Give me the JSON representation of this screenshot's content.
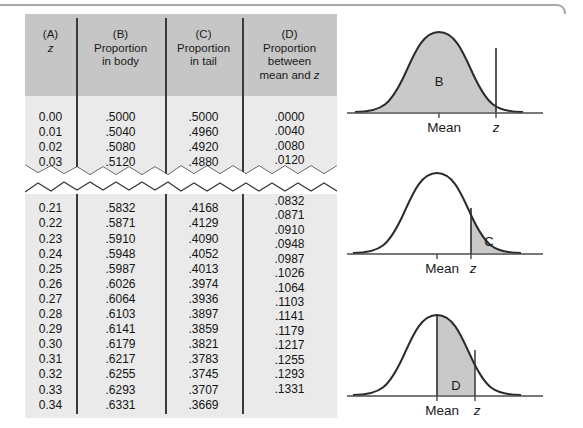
{
  "table": {
    "headers": [
      {
        "tag": "(A)",
        "lines": [
          "z"
        ],
        "italic_last": true
      },
      {
        "tag": "(B)",
        "lines": [
          "Proportion",
          "in body"
        ],
        "italic_last": false
      },
      {
        "tag": "(C)",
        "lines": [
          "Proportion",
          "in tail"
        ],
        "italic_last": false
      },
      {
        "tag": "(D)",
        "lines": [
          "Proportion",
          "between",
          "mean and z"
        ],
        "italic_last": false
      }
    ],
    "column_a_top": [
      "0.00",
      "0.01",
      "0.02",
      "0.03"
    ],
    "column_b_top": [
      ".5000",
      ".5040",
      ".5080",
      ".5120"
    ],
    "column_c_top": [
      ".5000",
      ".4960",
      ".4920",
      ".4880"
    ],
    "column_d_top": [
      ".0000",
      ".0040",
      ".0080",
      ".0120"
    ],
    "column_a_bottom": [
      "0.21",
      "0.22",
      "0.23",
      "0.24",
      "0.25",
      "0.26",
      "0.27",
      "0.28",
      "0.29",
      "0.30",
      "0.31",
      "0.32",
      "0.33",
      "0.34"
    ],
    "column_b_bottom": [
      ".5832",
      ".5871",
      ".5910",
      ".5948",
      ".5987",
      ".6026",
      ".6064",
      ".6103",
      ".6141",
      ".6179",
      ".6217",
      ".6255",
      ".6293",
      ".6331"
    ],
    "column_c_bottom": [
      ".4168",
      ".4129",
      ".4090",
      ".4052",
      ".4013",
      ".3974",
      ".3936",
      ".3897",
      ".3859",
      ".3821",
      ".3783",
      ".3745",
      ".3707",
      ".3669"
    ],
    "column_d_bottom": [
      ".0832",
      ".0871",
      ".0910",
      ".0948",
      ".0987",
      ".1026",
      ".1064",
      ".1103",
      ".1141",
      ".1179",
      ".1217",
      ".1255",
      ".1293",
      ".1331"
    ]
  },
  "figures": [
    {
      "region_label": "B",
      "axis_mean_label": "Mean",
      "axis_z_label": "z",
      "shaded": "body-left-of-z"
    },
    {
      "region_label": "C",
      "axis_mean_label": "Mean",
      "axis_z_label": "z",
      "shaded": "tail-right-of-z"
    },
    {
      "region_label": "D",
      "axis_mean_label": "Mean",
      "axis_z_label": "z",
      "shaded": "between-mean-and-z"
    }
  ],
  "colors": {
    "panel_background": "#eaeaea",
    "header_background": "#c6c6c6",
    "rule": "#3a3a3a",
    "curve_shade": "#c9c9c9",
    "curve_stroke": "#2b2b2b",
    "top_rule": "#a8a8a8"
  }
}
